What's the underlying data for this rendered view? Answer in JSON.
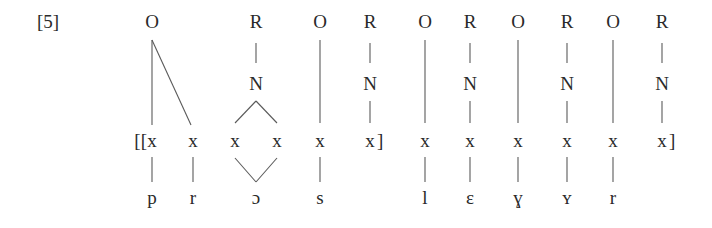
{
  "example_number": "[5]",
  "colors": {
    "text": "#2a2a2a",
    "line": "#5a5a5a",
    "background": "#ffffff"
  },
  "top_row": [
    {
      "label": "O",
      "x": 152
    },
    {
      "label": "R",
      "x": 256
    },
    {
      "label": "O",
      "x": 320
    },
    {
      "label": "R",
      "x": 370
    },
    {
      "label": "O",
      "x": 425
    },
    {
      "label": "R",
      "x": 470
    },
    {
      "label": "O",
      "x": 518
    },
    {
      "label": "R",
      "x": 567
    },
    {
      "label": "O",
      "x": 613
    },
    {
      "label": "R",
      "x": 662
    }
  ],
  "nucleus_row": [
    {
      "label": "N",
      "x": 256
    },
    {
      "label": "N",
      "x": 370
    },
    {
      "label": "N",
      "x": 470
    },
    {
      "label": "N",
      "x": 567
    },
    {
      "label": "N",
      "x": 662
    }
  ],
  "skeleton_row": {
    "slot_label": "x",
    "open_brackets": "[[",
    "close_bracket": "]",
    "slots": [
      152,
      193,
      235,
      277,
      320,
      370,
      425,
      470,
      518,
      567,
      613,
      662
    ],
    "bracket_after_slots": [
      370,
      662
    ]
  },
  "segment_row": [
    {
      "label": "p",
      "x": 152
    },
    {
      "label": "r",
      "x": 193
    },
    {
      "label": "ɔ",
      "x": 256
    },
    {
      "label": "s",
      "x": 320
    },
    {
      "label": "l",
      "x": 425
    },
    {
      "label": "ɛ",
      "x": 470
    },
    {
      "label": "ɣ",
      "x": 518
    },
    {
      "label": "ʏ",
      "x": 567
    },
    {
      "label": "r",
      "x": 613
    }
  ]
}
